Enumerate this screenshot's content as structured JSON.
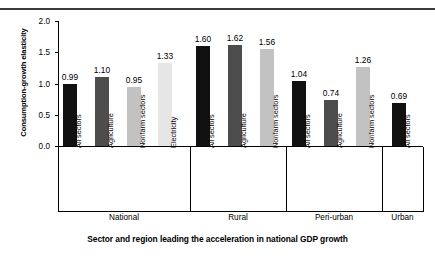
{
  "chart_data": {
    "type": "bar",
    "title": "",
    "xlabel": "Sector and region leading the acceleration in national GDP growth",
    "ylabel": "Consumption-growth elasticity",
    "ylim": [
      0.0,
      2.0
    ],
    "yticks": [
      "0.0",
      "0.5",
      "1.0",
      "1.5",
      "2.0"
    ],
    "ytick_values": [
      0.0,
      0.5,
      1.0,
      1.5,
      2.0
    ],
    "grid": false,
    "legend": "none",
    "categories": [
      "All sectors",
      "Agriculture",
      "Nonfarm sectors",
      "Electricity",
      "All sectors",
      "Agriculture",
      "Nonfarm sectors",
      "All sectors",
      "Agriculture",
      "Nonfarm sectors",
      "All sectors"
    ],
    "values": [
      0.99,
      1.1,
      0.95,
      1.33,
      1.6,
      1.62,
      1.56,
      1.04,
      0.74,
      1.26,
      0.69
    ],
    "value_labels": [
      "0.99",
      "1.10",
      "0.95",
      "1.33",
      "1.60",
      "1.62",
      "1.56",
      "1.04",
      "0.74",
      "1.26",
      "0.69"
    ],
    "bar_colors": [
      "#111111",
      "#4d4d4d",
      "#c2c2c2",
      "#e6e6e6",
      "#111111",
      "#4d4d4d",
      "#c2c2c2",
      "#111111",
      "#4d4d4d",
      "#c2c2c2",
      "#111111"
    ],
    "groups": [
      {
        "name": "National",
        "count": 4
      },
      {
        "name": "Rural",
        "count": 3
      },
      {
        "name": "Peri-urban",
        "count": 3
      },
      {
        "name": "Urban",
        "count": 1
      }
    ]
  }
}
